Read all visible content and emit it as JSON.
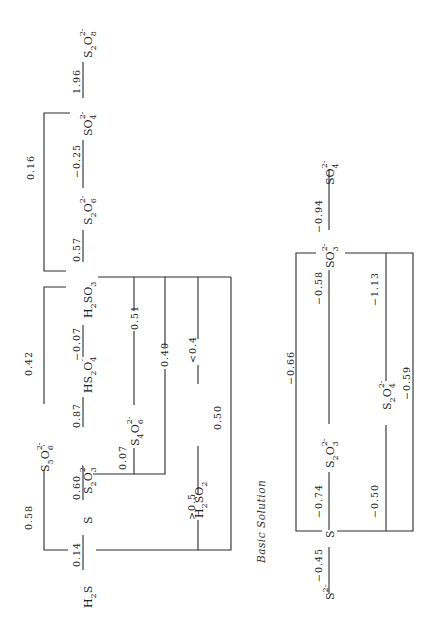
{
  "diagram": {
    "type": "Latimer diagram (sulfur)",
    "orientation": "rotated 90deg counter-clockwise",
    "acid": {
      "species": {
        "h2s": {
          "base": "H",
          "sub1": "2",
          "base2": "S"
        },
        "s": "S",
        "s2o3": {
          "a": "S",
          "a_sub": "2",
          "b": "O",
          "b_sub": "3",
          "charge": "2-"
        },
        "hs2o4": {
          "a": "HS",
          "a_sub": "2",
          "b": "O",
          "b_sub": "4",
          "charge": "-"
        },
        "h2so3": {
          "a": "H",
          "a_sub": "2",
          "b": "SO",
          "b_sub": "3"
        },
        "s2o6": {
          "a": "S",
          "a_sub": "2",
          "b": "O",
          "b_sub": "6",
          "charge": "2-"
        },
        "so4": {
          "a": "SO",
          "a_sub": "4",
          "charge": "2-"
        },
        "s2o8": {
          "a": "S",
          "a_sub": "2",
          "b": "O",
          "b_sub": "8",
          "charge": "2-"
        },
        "s5o6": {
          "a": "S",
          "a_sub": "5",
          "b": "O",
          "b_sub": "6",
          "charge": "2-"
        },
        "s4o6": {
          "a": "S",
          "a_sub": "4",
          "b": "O",
          "b_sub": "6",
          "charge": "2-"
        },
        "h2so2": {
          "a": "H",
          "a_sub": "2",
          "b": "SO",
          "b_sub": "2"
        }
      },
      "potentials": {
        "h2s_s": "0.14",
        "s_s2o3": "0.60",
        "s2o3_hs2o4": "0.87",
        "hs2o4_h2so3": "−0.07",
        "h2so3_s2o6": "0.57",
        "s2o6_so4": "−0.25",
        "so4_s2o8": "1.96",
        "h2s_s5o6": "0.58",
        "s5o6_h2so3": "0.42",
        "h2so3_so4": "0.16",
        "s2o3_s4o6": "0.07",
        "s4o6_h2so3": "0.51",
        "s2o3_h2so3": "0.40",
        "h2s_h2so2": ">0.5",
        "h2so2_h2so3": "<0.4",
        "h2s_h2so3": "0.50"
      }
    },
    "basic": {
      "caption": "Basic Solution",
      "species": {
        "s2": {
          "a": "S",
          "charge": "2-"
        },
        "s": "S",
        "s2o3": {
          "a": "S",
          "a_sub": "2",
          "b": "O",
          "b_sub": "3",
          "charge": "2-"
        },
        "so3": {
          "a": "SO",
          "a_sub": "3",
          "charge": "2-"
        },
        "so4": {
          "a": "SO",
          "a_sub": "4",
          "charge": "2-"
        },
        "s2o4": {
          "a": "S",
          "a_sub": "2",
          "b": "O",
          "b_sub": "4",
          "charge": "2-"
        }
      },
      "potentials": {
        "s2_s": "−0.45",
        "s_s2o3": "−0.74",
        "s2o3_so3": "−0.58",
        "so3_so4": "−0.94",
        "s_so3": "−0.66",
        "s_s2o4": "−0.50",
        "s2o4_so3": "−1.13",
        "s_so3_via": "−0.59"
      }
    }
  }
}
